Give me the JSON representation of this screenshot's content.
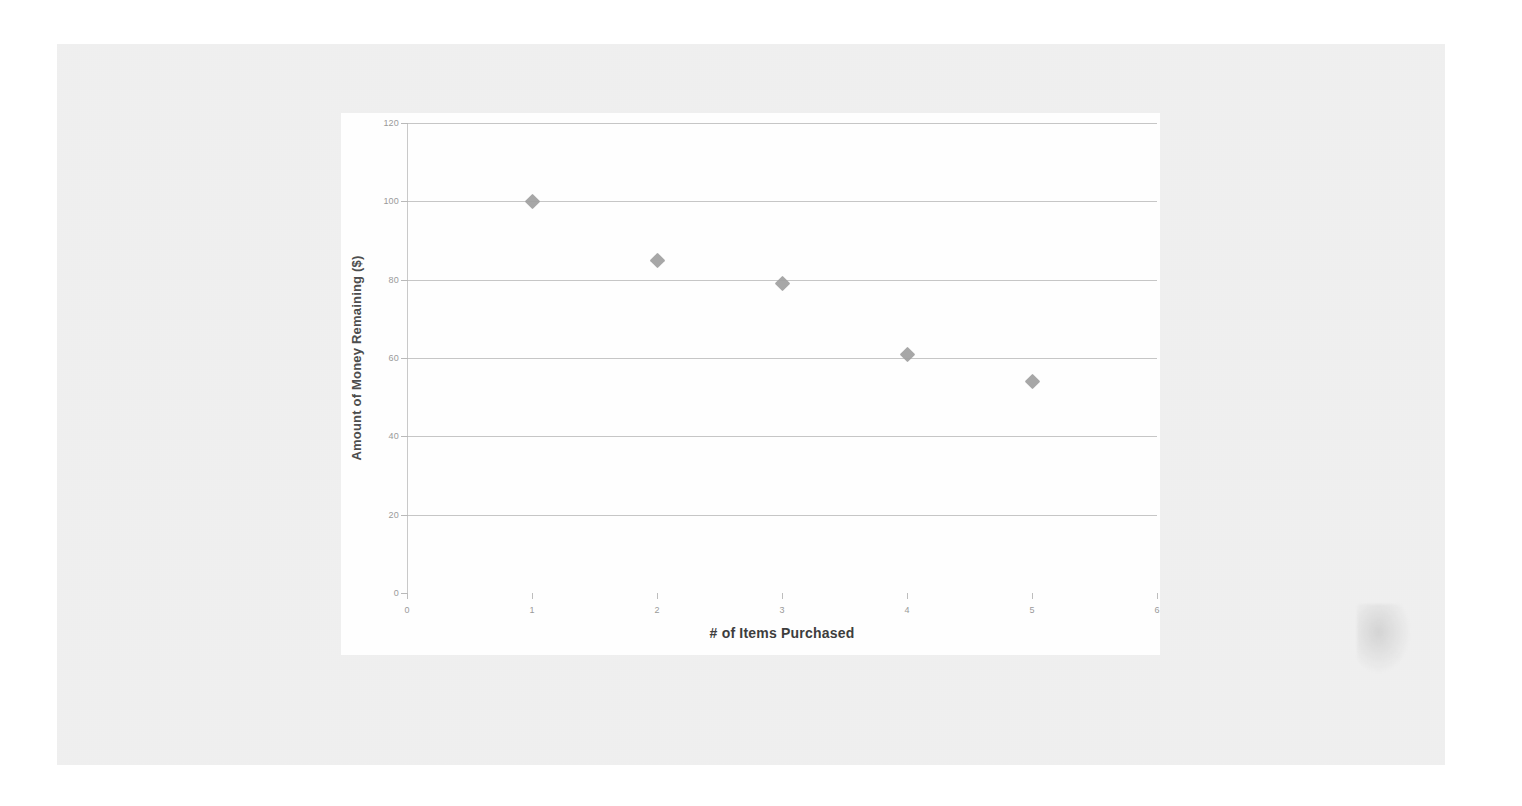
{
  "document": {
    "kind": "scanned-worksheet-figure",
    "background_color": "#ffffff",
    "scan_area_color": "#e3e3e3",
    "card_color": "#fefefe"
  },
  "chart_data": {
    "type": "scatter",
    "title": "",
    "xlabel": "# of Items Purchased",
    "ylabel": "Amount of Money Remaining ($)",
    "x": [
      1,
      2,
      3,
      4,
      5
    ],
    "values": [
      100,
      85,
      79,
      61,
      54
    ],
    "series": [
      {
        "name": "Money Remaining",
        "marker": "diamond",
        "color": "#a0a0a0",
        "points": [
          {
            "x": 1,
            "y": 100
          },
          {
            "x": 2,
            "y": 85
          },
          {
            "x": 3,
            "y": 79
          },
          {
            "x": 4,
            "y": 61
          },
          {
            "x": 5,
            "y": 54
          }
        ]
      }
    ],
    "xlim": [
      0,
      6
    ],
    "ylim": [
      0,
      120
    ],
    "xticks": [
      0,
      1,
      2,
      3,
      4,
      5,
      6
    ],
    "yticks": [
      0,
      20,
      40,
      60,
      80,
      100,
      120
    ],
    "xtick_labels": [
      "0",
      "1",
      "2",
      "3",
      "4",
      "5",
      "6"
    ],
    "ytick_labels": [
      "0",
      "20",
      "40",
      "60",
      "80",
      "100",
      "120"
    ],
    "grid": "horizontal",
    "legend": "none",
    "axis_label_color": "#9a9a9a",
    "gridline_color": "#c6c6c6"
  }
}
